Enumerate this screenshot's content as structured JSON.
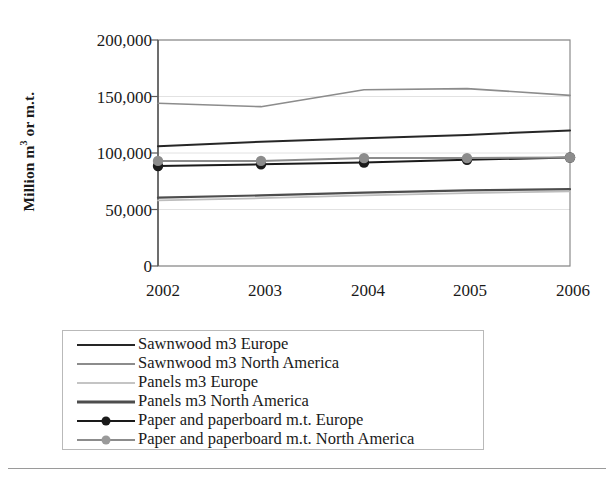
{
  "chart_data": {
    "type": "line",
    "title": "",
    "xlabel": "",
    "ylabel": "Million m3 or m.t.",
    "categories": [
      "2002",
      "2003",
      "2004",
      "2005",
      "2006"
    ],
    "x": [
      2002,
      2003,
      2004,
      2005,
      2006
    ],
    "ylim": [
      0,
      200000
    ],
    "ytick_labels": [
      "0",
      "50,000",
      "100,000",
      "150,000",
      "200,000"
    ],
    "ytick_values": [
      0,
      50000,
      100000,
      150000,
      200000
    ],
    "grid": true,
    "legend_position": "below-plot",
    "series": [
      {
        "name": "Sawnwood m3 Europe",
        "color": "#262626",
        "marker": "none",
        "width": 2.0,
        "values": [
          106000,
          110000,
          113000,
          116000,
          120000
        ]
      },
      {
        "name": "Sawnwood m3 North America",
        "color": "#8c8c8c",
        "marker": "none",
        "width": 1.6,
        "values": [
          144000,
          141000,
          156000,
          157000,
          151000
        ]
      },
      {
        "name": "Panels m3 Europe",
        "color": "#bdbdbd",
        "marker": "none",
        "width": 1.8,
        "values": [
          58000,
          60000,
          62500,
          64500,
          66000
        ]
      },
      {
        "name": "Panels m3 North America",
        "color": "#4d4d4d",
        "marker": "none",
        "width": 2.2,
        "values": [
          60500,
          62500,
          65000,
          67000,
          68000
        ]
      },
      {
        "name": "Paper and paperboard m.t. Europe",
        "color": "#1a1a1a",
        "marker": "circle",
        "width": 2.0,
        "values": [
          88500,
          90000,
          91500,
          94000,
          96000
        ]
      },
      {
        "name": "Paper and paperboard m.t. North America",
        "color": "#8c8c8c",
        "marker": "circle",
        "width": 2.0,
        "values": [
          93000,
          93000,
          95500,
          95500,
          96000
        ]
      }
    ]
  },
  "axis": {
    "y_title_prefix": "Million m",
    "y_title_sup": "3",
    "y_title_suffix": " or m.t."
  }
}
